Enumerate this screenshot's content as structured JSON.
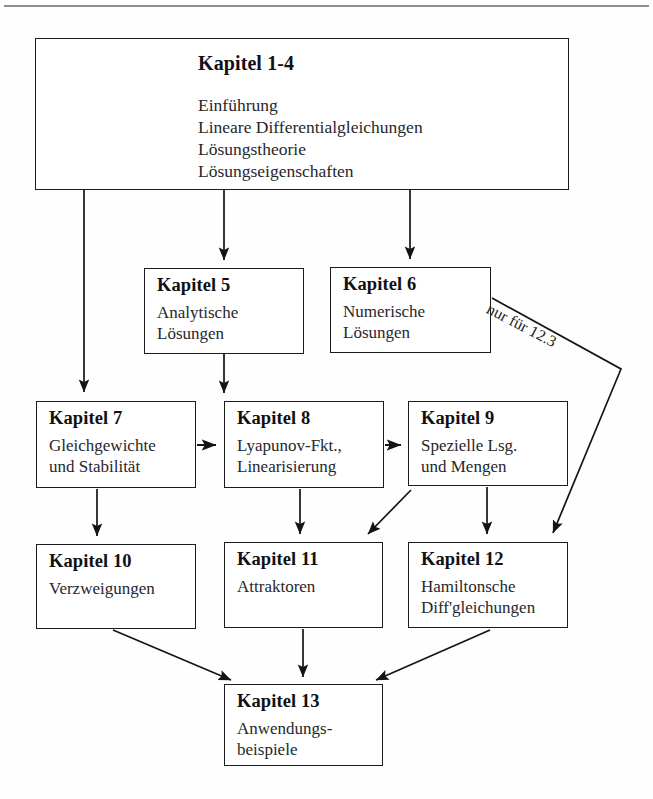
{
  "diagram": {
    "annotation": {
      "nur_fuer": "nur für 12.3"
    },
    "boxes": [
      {
        "id": "1-4",
        "title": "Kapitel 1-4",
        "lines": "Einführung\nLineare Differentialgleichungen\nLösungstheorie\nLösungseigenschaften"
      },
      {
        "id": "5",
        "title": "Kapitel 5",
        "lines": "Analytische\nLösungen"
      },
      {
        "id": "6",
        "title": "Kapitel 6",
        "lines": "Numerische\nLösungen"
      },
      {
        "id": "7",
        "title": "Kapitel 7",
        "lines": "Gleichgewichte\nund Stabilität"
      },
      {
        "id": "8",
        "title": "Kapitel 8",
        "lines": "Lyapunov-Fkt.,\nLinearisierung"
      },
      {
        "id": "9",
        "title": "Kapitel 9",
        "lines": "Spezielle Lsg.\nund Mengen"
      },
      {
        "id": "10",
        "title": "Kapitel 10",
        "lines": "Verzweigungen"
      },
      {
        "id": "11",
        "title": "Kapitel 11",
        "lines": "Attraktoren"
      },
      {
        "id": "12",
        "title": "Kapitel 12",
        "lines": "Hamiltonsche\nDiff'gleichungen"
      },
      {
        "id": "13",
        "title": "Kapitel 13",
        "lines": "Anwendungs-\nbeispiele"
      }
    ],
    "edges": [
      {
        "from": "1-4",
        "to": "7",
        "kind": "vertical-long"
      },
      {
        "from": "1-4",
        "to": "5",
        "kind": "vertical"
      },
      {
        "from": "1-4",
        "to": "6",
        "kind": "vertical"
      },
      {
        "from": "5",
        "to": "8",
        "kind": "vertical"
      },
      {
        "from": "7",
        "to": "8",
        "kind": "horizontal"
      },
      {
        "from": "8",
        "to": "9",
        "kind": "horizontal"
      },
      {
        "from": "7",
        "to": "10",
        "kind": "vertical"
      },
      {
        "from": "8",
        "to": "11",
        "kind": "vertical"
      },
      {
        "from": "9",
        "to": "11",
        "kind": "diagonal"
      },
      {
        "from": "9",
        "to": "12",
        "kind": "vertical"
      },
      {
        "from": "6",
        "to": "12",
        "kind": "polyline-annotated"
      },
      {
        "from": "10",
        "to": "13",
        "kind": "diagonal"
      },
      {
        "from": "11",
        "to": "13",
        "kind": "vertical"
      },
      {
        "from": "12",
        "to": "13",
        "kind": "diagonal"
      }
    ],
    "colors": {
      "ink": "#1b1b1f",
      "paper": "#ffffff",
      "rule": "#8e8e94"
    }
  }
}
